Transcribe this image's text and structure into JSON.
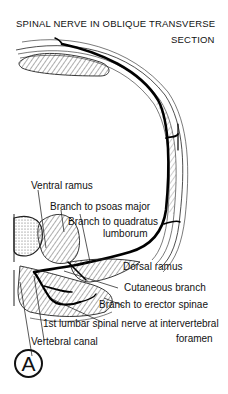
{
  "title": {
    "line1": "SPINAL NERVE IN OBLIQUE TRANSVERSE",
    "line2": "SECTION"
  },
  "labels": {
    "ventral_ramus": "Ventral ramus",
    "branch_psoas": "Branch to psoas major",
    "branch_quadratus_1": "Branch to quadratus",
    "branch_quadratus_2": "lumborum",
    "dorsal_ramus": "Dorsal ramus",
    "cutaneous_branch": "Cutaneous branch",
    "branch_erector": "Branch to erector spinae",
    "lumbar_nerve_1": "1st lumbar spinal nerve at intervertebral",
    "lumbar_nerve_2": "foramen",
    "vertebral_canal": "Vertebral canal"
  },
  "panel_badge": "A"
}
